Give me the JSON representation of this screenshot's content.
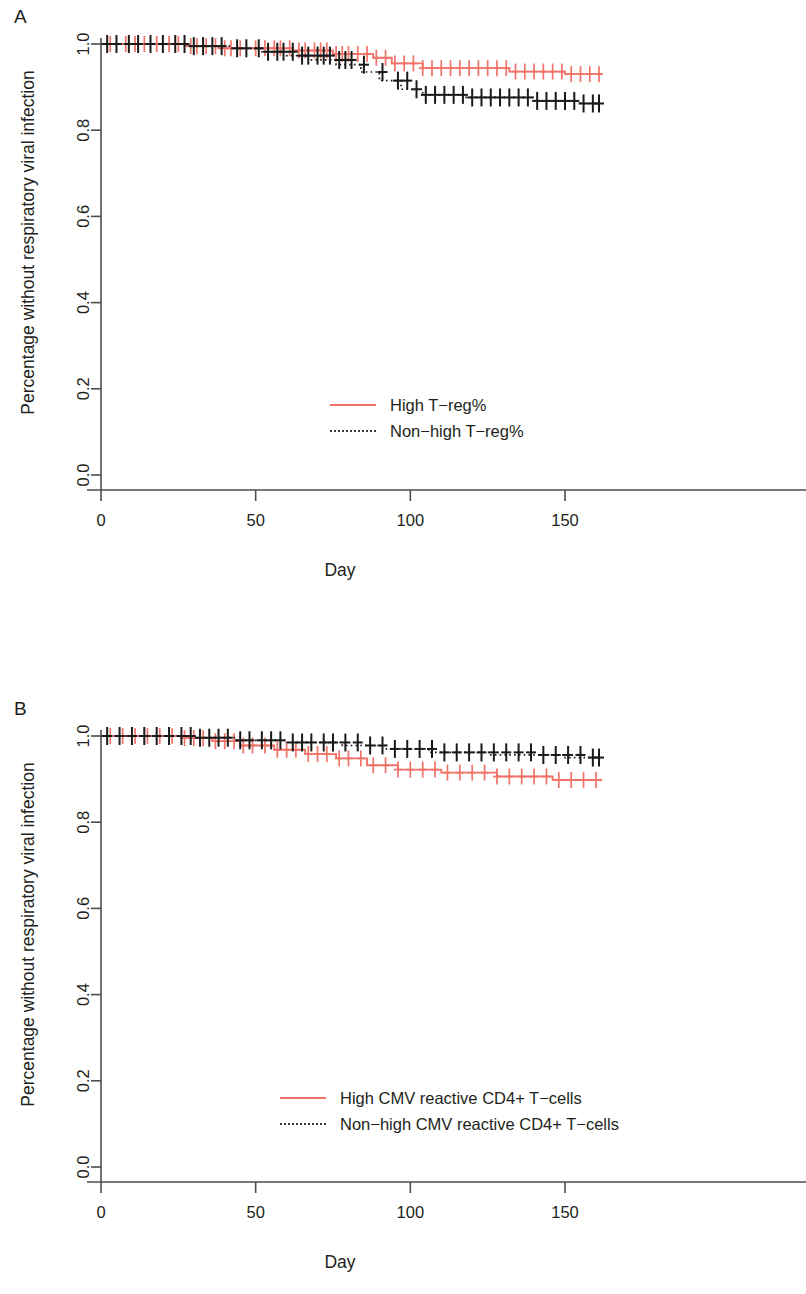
{
  "figure": {
    "panels": [
      {
        "id": "A",
        "label": "A",
        "axis": {
          "xlabel": "Day",
          "ylabel": "Percentage without respiratory viral infection",
          "xticks": [
            "0",
            "50",
            "100",
            "150"
          ],
          "xtick_values": [
            0,
            50,
            100,
            150
          ],
          "yticks": [
            "0.0",
            "0.2",
            "0.4",
            "0.6",
            "0.8",
            "1.0"
          ],
          "ytick_values": [
            0.0,
            0.2,
            0.4,
            0.6,
            0.8,
            1.0
          ],
          "xlim": [
            0,
            162
          ],
          "ylim": [
            0,
            1.0
          ]
        },
        "legend": [
          {
            "label": "High T−reg%",
            "style": "solid",
            "color": "#f0736a"
          },
          {
            "label": "Non−high T−reg%",
            "style": "dotted",
            "color": "#3a3a3a"
          }
        ]
      },
      {
        "id": "B",
        "label": "B",
        "axis": {
          "xlabel": "Day",
          "ylabel": "Percentage without respiratory viral infection",
          "xticks": [
            "0",
            "50",
            "100",
            "150"
          ],
          "xtick_values": [
            0,
            50,
            100,
            150
          ],
          "yticks": [
            "0.0",
            "0.2",
            "0.4",
            "0.6",
            "0.8",
            "1.0"
          ],
          "ytick_values": [
            0.0,
            0.2,
            0.4,
            0.6,
            0.8,
            1.0
          ],
          "xlim": [
            0,
            162
          ],
          "ylim": [
            0,
            1.0
          ]
        },
        "legend": [
          {
            "label": "High CMV reactive CD4+ T−cells",
            "style": "solid",
            "color": "#f0736a"
          },
          {
            "label": "Non−high CMV reactive CD4+ T−cells",
            "style": "dotted",
            "color": "#3a3a3a"
          }
        ]
      }
    ]
  },
  "chart_data": [
    {
      "type": "line",
      "subtype": "kaplan-meier",
      "panel": "A",
      "title": "",
      "xlabel": "Day",
      "ylabel": "Percentage without respiratory viral infection",
      "xlim": [
        0,
        162
      ],
      "ylim": [
        0,
        1.0
      ],
      "xticks": [
        0,
        50,
        100,
        150
      ],
      "yticks": [
        0.0,
        0.2,
        0.4,
        0.6,
        0.8,
        1.0
      ],
      "grid": false,
      "legend_position": "center",
      "series": [
        {
          "name": "High T−reg%",
          "color": "#f0736a",
          "style": "solid",
          "steps": [
            [
              0,
              1.0
            ],
            [
              27,
              1.0
            ],
            [
              27,
              0.995
            ],
            [
              38,
              0.995
            ],
            [
              38,
              0.99
            ],
            [
              62,
              0.99
            ],
            [
              62,
              0.985
            ],
            [
              75,
              0.985
            ],
            [
              75,
              0.977
            ],
            [
              88,
              0.977
            ],
            [
              88,
              0.968
            ],
            [
              94,
              0.968
            ],
            [
              94,
              0.955
            ],
            [
              104,
              0.955
            ],
            [
              104,
              0.944
            ],
            [
              132,
              0.944
            ],
            [
              132,
              0.936
            ],
            [
              150,
              0.936
            ],
            [
              150,
              0.93
            ],
            [
              162,
              0.93
            ]
          ],
          "censor_x": [
            3,
            8,
            11,
            14,
            18,
            22,
            25,
            29,
            31,
            34,
            37,
            40,
            42,
            45,
            50,
            53,
            56,
            58,
            61,
            64,
            66,
            69,
            71,
            73,
            76,
            78,
            80,
            83,
            86,
            89,
            92,
            95,
            98,
            101,
            104,
            107,
            110,
            113,
            116,
            119,
            122,
            125,
            128,
            131,
            134,
            137,
            140,
            143,
            146,
            149,
            152,
            155,
            158,
            161
          ],
          "censor_y": [
            1.0,
            1.0,
            1.0,
            1.0,
            1.0,
            1.0,
            1.0,
            0.995,
            0.995,
            0.995,
            0.995,
            0.99,
            0.99,
            0.99,
            0.99,
            0.99,
            0.99,
            0.99,
            0.99,
            0.985,
            0.985,
            0.985,
            0.985,
            0.985,
            0.977,
            0.977,
            0.977,
            0.977,
            0.977,
            0.968,
            0.968,
            0.955,
            0.955,
            0.955,
            0.944,
            0.944,
            0.944,
            0.944,
            0.944,
            0.944,
            0.944,
            0.944,
            0.944,
            0.944,
            0.936,
            0.936,
            0.936,
            0.936,
            0.936,
            0.936,
            0.93,
            0.93,
            0.93,
            0.93
          ]
        },
        {
          "name": "Non−high T−reg%",
          "color": "#1a1a1a",
          "style": "dotted",
          "steps": [
            [
              0,
              1.0
            ],
            [
              28,
              1.0
            ],
            [
              28,
              0.995
            ],
            [
              42,
              0.995
            ],
            [
              42,
              0.99
            ],
            [
              52,
              0.99
            ],
            [
              52,
              0.982
            ],
            [
              60,
              0.982
            ],
            [
              60,
              0.973
            ],
            [
              68,
              0.973
            ],
            [
              68,
              0.963
            ],
            [
              76,
              0.963
            ],
            [
              76,
              0.952
            ],
            [
              84,
              0.952
            ],
            [
              84,
              0.935
            ],
            [
              90,
              0.935
            ],
            [
              90,
              0.915
            ],
            [
              97,
              0.915
            ],
            [
              97,
              0.895
            ],
            [
              104,
              0.895
            ],
            [
              104,
              0.882
            ],
            [
              118,
              0.882
            ],
            [
              118,
              0.876
            ],
            [
              140,
              0.876
            ],
            [
              140,
              0.868
            ],
            [
              155,
              0.868
            ],
            [
              155,
              0.862
            ],
            [
              162,
              0.862
            ]
          ],
          "censor_x": [
            2,
            5,
            9,
            12,
            16,
            20,
            24,
            27,
            30,
            33,
            36,
            39,
            44,
            47,
            51,
            54,
            57,
            59,
            62,
            65,
            67,
            70,
            72,
            74,
            77,
            79,
            81,
            85,
            91,
            96,
            99,
            102,
            105,
            108,
            111,
            114,
            117,
            120,
            123,
            126,
            129,
            132,
            135,
            138,
            141,
            144,
            147,
            150,
            153,
            156,
            159,
            161
          ],
          "censor_y": [
            1.0,
            1.0,
            1.0,
            1.0,
            1.0,
            1.0,
            1.0,
            1.0,
            0.995,
            0.995,
            0.995,
            0.995,
            0.99,
            0.99,
            0.99,
            0.982,
            0.982,
            0.982,
            0.982,
            0.973,
            0.973,
            0.973,
            0.973,
            0.973,
            0.963,
            0.963,
            0.963,
            0.952,
            0.935,
            0.915,
            0.915,
            0.895,
            0.882,
            0.882,
            0.882,
            0.882,
            0.882,
            0.876,
            0.876,
            0.876,
            0.876,
            0.876,
            0.876,
            0.876,
            0.868,
            0.868,
            0.868,
            0.868,
            0.868,
            0.862,
            0.862,
            0.862
          ]
        }
      ]
    },
    {
      "type": "line",
      "subtype": "kaplan-meier",
      "panel": "B",
      "title": "",
      "xlabel": "Day",
      "ylabel": "Percentage without respiratory viral infection",
      "xlim": [
        0,
        162
      ],
      "ylim": [
        0,
        1.0
      ],
      "xticks": [
        0,
        50,
        100,
        150
      ],
      "yticks": [
        0.0,
        0.2,
        0.4,
        0.6,
        0.8,
        1.0
      ],
      "grid": false,
      "legend_position": "center",
      "series": [
        {
          "name": "High CMV reactive CD4+ T−cells",
          "color": "#f0736a",
          "style": "solid",
          "steps": [
            [
              0,
              1.0
            ],
            [
              26,
              1.0
            ],
            [
              26,
              0.995
            ],
            [
              36,
              0.995
            ],
            [
              36,
              0.988
            ],
            [
              45,
              0.988
            ],
            [
              45,
              0.978
            ],
            [
              56,
              0.978
            ],
            [
              56,
              0.968
            ],
            [
              66,
              0.968
            ],
            [
              66,
              0.958
            ],
            [
              76,
              0.958
            ],
            [
              76,
              0.948
            ],
            [
              86,
              0.948
            ],
            [
              86,
              0.932
            ],
            [
              96,
              0.932
            ],
            [
              96,
              0.922
            ],
            [
              110,
              0.922
            ],
            [
              110,
              0.915
            ],
            [
              128,
              0.915
            ],
            [
              128,
              0.906
            ],
            [
              146,
              0.906
            ],
            [
              146,
              0.898
            ],
            [
              162,
              0.898
            ]
          ],
          "censor_x": [
            3,
            7,
            11,
            15,
            19,
            23,
            27,
            30,
            33,
            37,
            40,
            43,
            46,
            49,
            53,
            57,
            60,
            63,
            67,
            70,
            73,
            77,
            80,
            84,
            88,
            92,
            96,
            100,
            104,
            108,
            112,
            116,
            120,
            124,
            128,
            132,
            136,
            140,
            144,
            148,
            152,
            156,
            160
          ],
          "censor_y": [
            1.0,
            1.0,
            1.0,
            1.0,
            1.0,
            1.0,
            0.995,
            0.995,
            0.995,
            0.988,
            0.988,
            0.988,
            0.978,
            0.978,
            0.978,
            0.968,
            0.968,
            0.968,
            0.958,
            0.958,
            0.958,
            0.948,
            0.948,
            0.948,
            0.932,
            0.932,
            0.922,
            0.922,
            0.922,
            0.922,
            0.915,
            0.915,
            0.915,
            0.915,
            0.906,
            0.906,
            0.906,
            0.906,
            0.906,
            0.898,
            0.898,
            0.898,
            0.898
          ]
        },
        {
          "name": "Non−high CMV reactive CD4+ T−cells",
          "color": "#1a1a1a",
          "style": "dotted",
          "steps": [
            [
              0,
              1.0
            ],
            [
              30,
              1.0
            ],
            [
              30,
              0.996
            ],
            [
              44,
              0.996
            ],
            [
              44,
              0.99
            ],
            [
              60,
              0.99
            ],
            [
              60,
              0.985
            ],
            [
              78,
              0.985
            ],
            [
              78,
              0.978
            ],
            [
              92,
              0.978
            ],
            [
              92,
              0.97
            ],
            [
              106,
              0.97
            ],
            [
              106,
              0.962
            ],
            [
              126,
              0.962
            ],
            [
              126,
              0.956
            ],
            [
              150,
              0.956
            ],
            [
              150,
              0.95
            ],
            [
              162,
              0.95
            ]
          ],
          "censor_x": [
            2,
            6,
            10,
            14,
            18,
            22,
            26,
            29,
            32,
            35,
            38,
            41,
            45,
            48,
            52,
            55,
            58,
            62,
            65,
            68,
            72,
            75,
            79,
            83,
            87,
            91,
            95,
            99,
            103,
            107,
            111,
            115,
            119,
            123,
            127,
            131,
            135,
            139,
            143,
            147,
            151,
            155,
            159,
            161
          ],
          "censor_y": [
            1.0,
            1.0,
            1.0,
            1.0,
            1.0,
            1.0,
            1.0,
            1.0,
            0.996,
            0.996,
            0.996,
            0.996,
            0.99,
            0.99,
            0.99,
            0.99,
            0.99,
            0.985,
            0.985,
            0.985,
            0.985,
            0.985,
            0.985,
            0.985,
            0.978,
            0.978,
            0.97,
            0.97,
            0.97,
            0.97,
            0.962,
            0.962,
            0.962,
            0.962,
            0.962,
            0.962,
            0.962,
            0.962,
            0.956,
            0.956,
            0.956,
            0.956,
            0.95,
            0.95
          ]
        }
      ]
    }
  ]
}
